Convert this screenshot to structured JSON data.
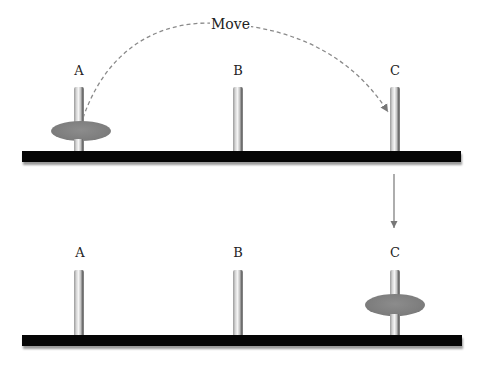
{
  "move_label": "Move",
  "top_panel": {
    "pegs": [
      {
        "label": "A",
        "has_disk": true
      },
      {
        "label": "B",
        "has_disk": false
      },
      {
        "label": "C",
        "has_disk": false
      }
    ]
  },
  "bottom_panel": {
    "pegs": [
      {
        "label": "A",
        "has_disk": false
      },
      {
        "label": "B",
        "has_disk": false
      },
      {
        "label": "C",
        "has_disk": true
      }
    ]
  },
  "colors": {
    "base": "#050505",
    "disk": "#7f7f7f",
    "arrow": "#777777"
  }
}
